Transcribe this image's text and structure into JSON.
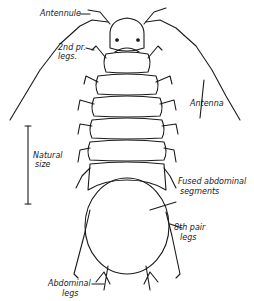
{
  "figure": {
    "ink_color": "#1a1a1a",
    "background": "#ffffff"
  },
  "labels": {
    "antennule": "Antennule",
    "second_pair_legs_1": "2nd pr.",
    "second_pair_legs_2": "legs.",
    "antenna": "Antenna",
    "natural_size_1": "Natural",
    "natural_size_2": "size",
    "fused_segments_1": "Fused abdominal",
    "fused_segments_2": "segments",
    "eighth_pair_legs_1": "8th pair",
    "eighth_pair_legs_2": "legs",
    "abdominal_legs_1": "Abdominal",
    "abdominal_legs_2": "legs"
  }
}
